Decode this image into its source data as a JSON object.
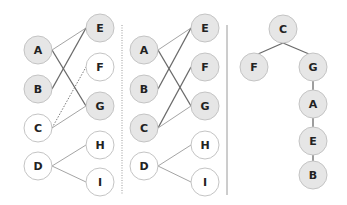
{
  "colors": {
    "node_filled": "#e6e6e6",
    "node_empty": "#ffffff",
    "node_stroke": "#c4c4c4",
    "edge_dark": "#6a6a6a",
    "edge_light": "#9a9a9a",
    "divider": "#9a9a9a",
    "label": "#222222"
  },
  "node_radius": 14,
  "panels": [
    {
      "id": "left",
      "nodes": [
        {
          "label": "A",
          "x": 38,
          "y": 50,
          "filled": true
        },
        {
          "label": "B",
          "x": 38,
          "y": 89,
          "filled": true
        },
        {
          "label": "C",
          "x": 38,
          "y": 128,
          "filled": false
        },
        {
          "label": "D",
          "x": 38,
          "y": 166,
          "filled": false
        },
        {
          "label": "E",
          "x": 100,
          "y": 28,
          "filled": true
        },
        {
          "label": "F",
          "x": 100,
          "y": 67,
          "filled": false
        },
        {
          "label": "G",
          "x": 100,
          "y": 106,
          "filled": true
        },
        {
          "label": "H",
          "x": 100,
          "y": 145,
          "filled": false
        },
        {
          "label": "I",
          "x": 100,
          "y": 182,
          "filled": false
        }
      ],
      "edges": [
        {
          "from": "A",
          "to": "E",
          "style": "light"
        },
        {
          "from": "A",
          "to": "G",
          "style": "dark"
        },
        {
          "from": "B",
          "to": "E",
          "style": "dark"
        },
        {
          "from": "C",
          "to": "F",
          "style": "dotted"
        },
        {
          "from": "C",
          "to": "G",
          "style": "light"
        },
        {
          "from": "D",
          "to": "H",
          "style": "light"
        },
        {
          "from": "D",
          "to": "I",
          "style": "light"
        }
      ]
    },
    {
      "id": "middle",
      "nodes": [
        {
          "label": "A",
          "x": 144,
          "y": 50,
          "filled": true
        },
        {
          "label": "B",
          "x": 144,
          "y": 89,
          "filled": true
        },
        {
          "label": "C",
          "x": 144,
          "y": 128,
          "filled": true
        },
        {
          "label": "D",
          "x": 144,
          "y": 166,
          "filled": false
        },
        {
          "label": "E",
          "x": 205,
          "y": 28,
          "filled": true
        },
        {
          "label": "F",
          "x": 205,
          "y": 67,
          "filled": true
        },
        {
          "label": "G",
          "x": 205,
          "y": 106,
          "filled": true
        },
        {
          "label": "H",
          "x": 205,
          "y": 145,
          "filled": false
        },
        {
          "label": "I",
          "x": 205,
          "y": 182,
          "filled": false
        }
      ],
      "edges": [
        {
          "from": "A",
          "to": "E",
          "style": "light"
        },
        {
          "from": "A",
          "to": "G",
          "style": "dark"
        },
        {
          "from": "B",
          "to": "E",
          "style": "dark"
        },
        {
          "from": "C",
          "to": "F",
          "style": "dark"
        },
        {
          "from": "C",
          "to": "G",
          "style": "light"
        },
        {
          "from": "D",
          "to": "H",
          "style": "light"
        },
        {
          "from": "D",
          "to": "I",
          "style": "light"
        }
      ]
    },
    {
      "id": "tree",
      "nodes": [
        {
          "label": "C",
          "x": 283,
          "y": 29,
          "filled": true
        },
        {
          "label": "F",
          "x": 254,
          "y": 67,
          "filled": true
        },
        {
          "label": "G",
          "x": 313,
          "y": 67,
          "filled": true
        },
        {
          "label": "A",
          "x": 313,
          "y": 104,
          "filled": true
        },
        {
          "label": "E",
          "x": 313,
          "y": 141,
          "filled": true
        },
        {
          "label": "B",
          "x": 313,
          "y": 175,
          "filled": true
        }
      ],
      "edges": [
        {
          "from": "C",
          "to": "F",
          "style": "dark",
          "type": "tree"
        },
        {
          "from": "C",
          "to": "G",
          "style": "dark",
          "type": "tree"
        },
        {
          "from": "G",
          "to": "A",
          "style": "dark"
        },
        {
          "from": "A",
          "to": "E",
          "style": "dark"
        },
        {
          "from": "E",
          "to": "B",
          "style": "dark"
        }
      ]
    }
  ],
  "dividers": [
    {
      "x": 122,
      "y1": 25,
      "y2": 195,
      "dotted": true
    },
    {
      "x": 227,
      "y1": 25,
      "y2": 195,
      "dotted": false
    }
  ]
}
